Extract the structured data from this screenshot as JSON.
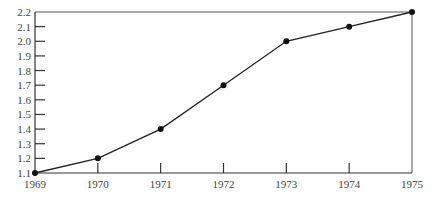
{
  "chart_data": {
    "type": "line",
    "title": "",
    "xlabel": "",
    "ylabel": "",
    "x": [
      "1969",
      "1970",
      "1971",
      "1972",
      "1973",
      "1974",
      "1975"
    ],
    "series": [
      {
        "name": "",
        "values": [
          1.1,
          1.2,
          1.4,
          1.7,
          2.0,
          2.1,
          2.2
        ]
      }
    ],
    "ylim": [
      1.1,
      2.2
    ],
    "yticks": [
      "1.1",
      "1.2",
      "1.3",
      "1.4",
      "1.5",
      "1.6",
      "1.7",
      "1.8",
      "1.9",
      "2.0",
      "2.1",
      "2.2"
    ],
    "xticks": [
      "1969",
      "1970",
      "1971",
      "1972",
      "1973",
      "1974",
      "1975"
    ],
    "grid": false,
    "legend": null,
    "markers": "filled-circle",
    "colors": {
      "line": "#222222",
      "marker": "#111111",
      "axis": "#333333",
      "text": "#444444"
    }
  }
}
